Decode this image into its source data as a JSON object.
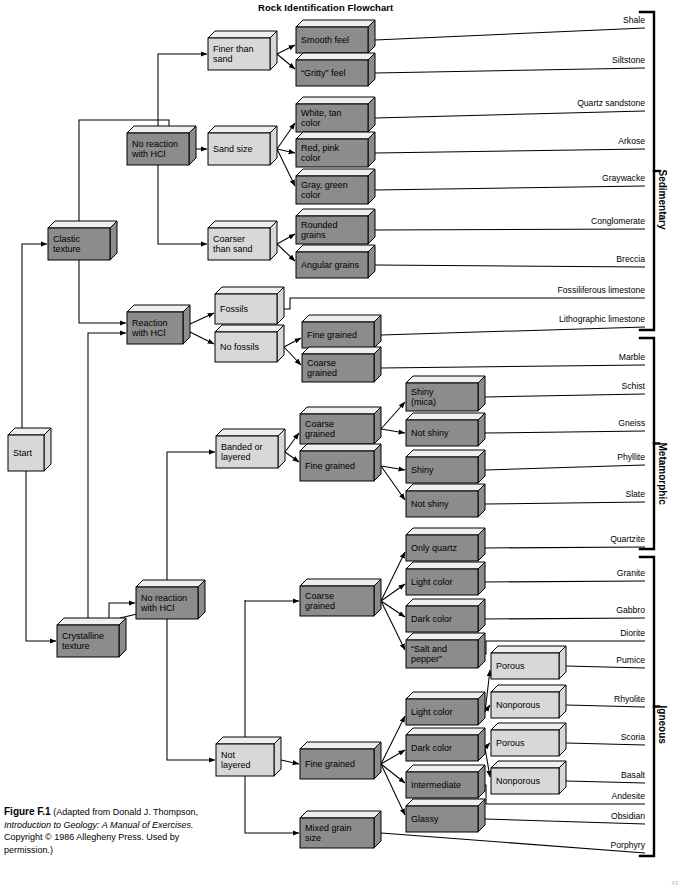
{
  "title": "Rock Identification Flowchart",
  "caption": {
    "figure_label": "Figure F.1",
    "line1": "(Adapted from Donald J. Thompson,",
    "line2_italic": "Introduction to Geology: A Manual of Exercises.",
    "line3": "Copyright © 1986 Allegheny Press. Used by",
    "line4": "permission.)"
  },
  "page_mark": "43",
  "colors": {
    "box_dark_face": "#8c8c8c",
    "box_light_face": "#d8d8d8",
    "box_top": "#efefef",
    "outline": "#000000",
    "background": "#ffffff"
  },
  "boxes": [
    {
      "id": "start",
      "label": "Start",
      "style": "light",
      "x": 8,
      "y": 435,
      "w": 36,
      "h": 36
    },
    {
      "id": "clastic",
      "label": "Clastic\ntexture",
      "style": "dark",
      "x": 48,
      "y": 228,
      "w": 62,
      "h": 32
    },
    {
      "id": "crystalline",
      "label": "Crystalline\ntexture",
      "style": "dark",
      "x": 57,
      "y": 625,
      "w": 62,
      "h": 32
    },
    {
      "id": "no-reaction-1",
      "label": "No reaction\nwith HCl",
      "style": "dark",
      "x": 127,
      "y": 133,
      "w": 62,
      "h": 32
    },
    {
      "id": "reaction",
      "label": "Reaction\nwith HCl",
      "style": "dark",
      "x": 127,
      "y": 312,
      "w": 56,
      "h": 32
    },
    {
      "id": "no-reaction-2",
      "label": "No reaction\nwith HCl",
      "style": "dark",
      "x": 136,
      "y": 587,
      "w": 62,
      "h": 32
    },
    {
      "id": "finer-than-sand",
      "label": "Finer than\nsand",
      "style": "light",
      "x": 208,
      "y": 38,
      "w": 62,
      "h": 32
    },
    {
      "id": "sand-size",
      "label": "Sand size",
      "style": "light",
      "x": 208,
      "y": 133,
      "w": 62,
      "h": 32
    },
    {
      "id": "coarser-than-sand",
      "label": "Coarser\nthan sand",
      "style": "light",
      "x": 208,
      "y": 228,
      "w": 62,
      "h": 32
    },
    {
      "id": "fossils",
      "label": "Fossils",
      "style": "light",
      "x": 215,
      "y": 294,
      "w": 62,
      "h": 30
    },
    {
      "id": "no-fossils",
      "label": "No fossils",
      "style": "light",
      "x": 215,
      "y": 332,
      "w": 62,
      "h": 30
    },
    {
      "id": "banded-layered",
      "label": "Banded or\nlayered",
      "style": "light",
      "x": 216,
      "y": 436,
      "w": 62,
      "h": 32
    },
    {
      "id": "not-layered",
      "label": "Not\nlayered",
      "style": "light",
      "x": 216,
      "y": 744,
      "w": 58,
      "h": 32
    },
    {
      "id": "smooth-feel",
      "label": "Smooth feel",
      "style": "dark",
      "x": 296,
      "y": 27,
      "w": 72,
      "h": 26
    },
    {
      "id": "gritty-feel",
      "label": "“Gritty” feel",
      "style": "dark",
      "x": 296,
      "y": 60,
      "w": 72,
      "h": 26
    },
    {
      "id": "white-tan",
      "label": "White, tan\ncolor",
      "style": "dark",
      "x": 296,
      "y": 104,
      "w": 72,
      "h": 28
    },
    {
      "id": "red-pink",
      "label": "Red, pink\ncolor",
      "style": "dark",
      "x": 296,
      "y": 139,
      "w": 72,
      "h": 28
    },
    {
      "id": "gray-green",
      "label": "Gray, green\ncolor",
      "style": "dark",
      "x": 296,
      "y": 176,
      "w": 72,
      "h": 28
    },
    {
      "id": "rounded-grains",
      "label": "Rounded\ngrains",
      "style": "dark",
      "x": 296,
      "y": 216,
      "w": 72,
      "h": 28
    },
    {
      "id": "angular-grains",
      "label": "Angular grains",
      "style": "dark",
      "x": 296,
      "y": 252,
      "w": 72,
      "h": 26
    },
    {
      "id": "fine-grained-sed",
      "label": "Fine grained",
      "style": "dark",
      "x": 302,
      "y": 322,
      "w": 72,
      "h": 26
    },
    {
      "id": "coarse-grained-sed",
      "label": "Coarse\ngrained",
      "style": "dark",
      "x": 302,
      "y": 354,
      "w": 72,
      "h": 28
    },
    {
      "id": "coarse-grained-met",
      "label": "Coarse\ngrained",
      "style": "dark",
      "x": 300,
      "y": 414,
      "w": 74,
      "h": 30
    },
    {
      "id": "fine-grained-met",
      "label": "Fine grained",
      "style": "dark",
      "x": 300,
      "y": 451,
      "w": 74,
      "h": 30
    },
    {
      "id": "coarse-grained-ign",
      "label": "Coarse\ngrained",
      "style": "dark",
      "x": 300,
      "y": 586,
      "w": 74,
      "h": 30
    },
    {
      "id": "fine-grained-ign",
      "label": "Fine grained",
      "style": "dark",
      "x": 300,
      "y": 749,
      "w": 74,
      "h": 30
    },
    {
      "id": "mixed-grain-size",
      "label": "Mixed grain\nsize",
      "style": "dark",
      "x": 300,
      "y": 818,
      "w": 74,
      "h": 30
    },
    {
      "id": "shiny-mica",
      "label": "Shiny\n(mica)",
      "style": "dark",
      "x": 406,
      "y": 383,
      "w": 72,
      "h": 28
    },
    {
      "id": "not-shiny-1",
      "label": "Not shiny",
      "style": "dark",
      "x": 406,
      "y": 420,
      "w": 72,
      "h": 26
    },
    {
      "id": "shiny",
      "label": "Shiny",
      "style": "dark",
      "x": 406,
      "y": 457,
      "w": 72,
      "h": 26
    },
    {
      "id": "not-shiny-2",
      "label": "Not shiny",
      "style": "dark",
      "x": 406,
      "y": 491,
      "w": 72,
      "h": 26
    },
    {
      "id": "only-quartz",
      "label": "Only quartz",
      "style": "dark",
      "x": 406,
      "y": 535,
      "w": 72,
      "h": 26
    },
    {
      "id": "light-color-ign-c",
      "label": "Light color",
      "style": "dark",
      "x": 406,
      "y": 569,
      "w": 72,
      "h": 26
    },
    {
      "id": "dark-color-ign-c",
      "label": "Dark color",
      "style": "dark",
      "x": 406,
      "y": 606,
      "w": 72,
      "h": 26
    },
    {
      "id": "salt-and-pepper",
      "label": "“Salt and\npepper”",
      "style": "dark",
      "x": 406,
      "y": 640,
      "w": 72,
      "h": 28
    },
    {
      "id": "light-color-ign-f",
      "label": "Light color",
      "style": "dark",
      "x": 406,
      "y": 699,
      "w": 72,
      "h": 26
    },
    {
      "id": "dark-color-ign-f",
      "label": "Dark color",
      "style": "dark",
      "x": 406,
      "y": 735,
      "w": 72,
      "h": 26
    },
    {
      "id": "intermediate",
      "label": "Intermediate",
      "style": "dark",
      "x": 406,
      "y": 772,
      "w": 72,
      "h": 26
    },
    {
      "id": "glassy",
      "label": "Glassy",
      "style": "dark",
      "x": 406,
      "y": 806,
      "w": 72,
      "h": 26
    },
    {
      "id": "porous-1",
      "label": "Porous",
      "style": "light",
      "x": 491,
      "y": 653,
      "w": 68,
      "h": 26
    },
    {
      "id": "nonporous-1",
      "label": "Nonporous",
      "style": "light",
      "x": 491,
      "y": 692,
      "w": 68,
      "h": 26
    },
    {
      "id": "porous-2",
      "label": "Porous",
      "style": "light",
      "x": 491,
      "y": 730,
      "w": 68,
      "h": 26
    },
    {
      "id": "nonporous-2",
      "label": "Nonporous",
      "style": "light",
      "x": 491,
      "y": 768,
      "w": 68,
      "h": 26
    }
  ],
  "rock_labels": [
    {
      "id": "shale",
      "text": "Shale",
      "x": 600,
      "y": 15
    },
    {
      "id": "siltstone",
      "text": "Siltstone",
      "x": 600,
      "y": 55
    },
    {
      "id": "quartz-sandstone",
      "text": "Quartz sandstone",
      "x": 600,
      "y": 98
    },
    {
      "id": "arkose",
      "text": "Arkose",
      "x": 600,
      "y": 136
    },
    {
      "id": "graywacke",
      "text": "Graywacke",
      "x": 600,
      "y": 173
    },
    {
      "id": "conglomerate",
      "text": "Conglomerate",
      "x": 600,
      "y": 216
    },
    {
      "id": "breccia",
      "text": "Breccia",
      "x": 600,
      "y": 254
    },
    {
      "id": "fossiliferous-limestone",
      "text": "Fossiliferous limestone",
      "x": 600,
      "y": 285
    },
    {
      "id": "lithographic-limestone",
      "text": "Lithographic limestone",
      "x": 600,
      "y": 314
    },
    {
      "id": "marble",
      "text": "Marble",
      "x": 600,
      "y": 352
    },
    {
      "id": "schist",
      "text": "Schist",
      "x": 600,
      "y": 381
    },
    {
      "id": "gneiss",
      "text": "Gneiss",
      "x": 600,
      "y": 418
    },
    {
      "id": "phyllite",
      "text": "Phyllite",
      "x": 600,
      "y": 452
    },
    {
      "id": "slate",
      "text": "Slate",
      "x": 600,
      "y": 489
    },
    {
      "id": "quartzite",
      "text": "Quartzite",
      "x": 600,
      "y": 534
    },
    {
      "id": "granite",
      "text": "Granite",
      "x": 600,
      "y": 568
    },
    {
      "id": "gabbro",
      "text": "Gabbro",
      "x": 600,
      "y": 605
    },
    {
      "id": "diorite",
      "text": "Diorite",
      "x": 600,
      "y": 628
    },
    {
      "id": "pumice",
      "text": "Pumice",
      "x": 600,
      "y": 655
    },
    {
      "id": "rhyolite",
      "text": "Rhyolite",
      "x": 600,
      "y": 694
    },
    {
      "id": "scoria",
      "text": "Scoria",
      "x": 600,
      "y": 732
    },
    {
      "id": "basalt",
      "text": "Basalt",
      "x": 600,
      "y": 770
    },
    {
      "id": "andesite",
      "text": "Andesite",
      "x": 600,
      "y": 791
    },
    {
      "id": "obsidian",
      "text": "Obsidian",
      "x": 600,
      "y": 811
    },
    {
      "id": "porphyry",
      "text": "Porphyry",
      "x": 600,
      "y": 840
    }
  ],
  "brackets": [
    {
      "id": "sedimentary",
      "label": "Sedimentary",
      "top": 12,
      "bottom": 330,
      "x": 654
    },
    {
      "id": "metamorphic",
      "label": "Metamorphic",
      "top": 338,
      "bottom": 549,
      "x": 654
    },
    {
      "id": "igneous",
      "label": "Igneous",
      "top": 557,
      "bottom": 856,
      "x": 654
    }
  ]
}
